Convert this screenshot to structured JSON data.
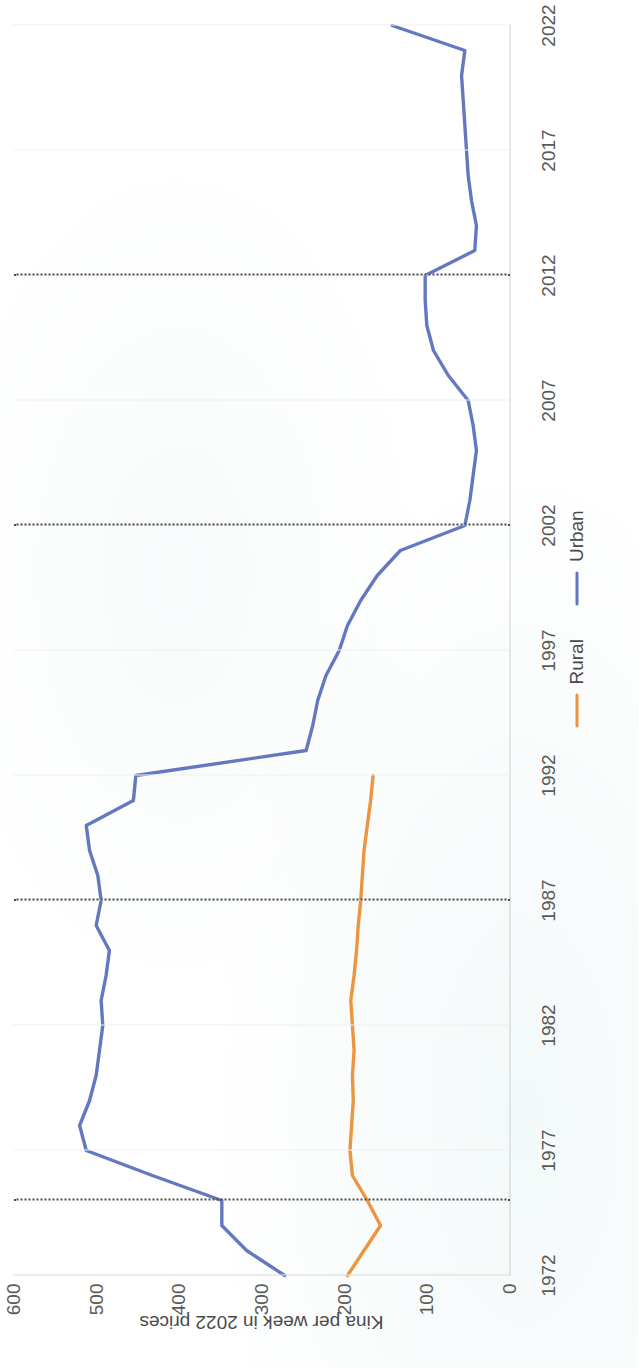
{
  "chart_data": {
    "type": "line",
    "title": "",
    "xlabel": "",
    "ylabel": "Kina per week in 2022 prices",
    "xlim": [
      1972,
      2022
    ],
    "ylim": [
      0,
      600
    ],
    "y_ticks": [
      0,
      100,
      200,
      300,
      400,
      500,
      600
    ],
    "x_ticks": [
      1972,
      1977,
      1982,
      1987,
      1992,
      1997,
      2002,
      2007,
      2012,
      2017,
      2022
    ],
    "grid": "vertical-light",
    "legend_position": "bottom-right",
    "reference_lines": [
      1975,
      1987,
      2002,
      2012
    ],
    "series": [
      {
        "name": "Rural",
        "color": "#ED9440",
        "x": [
          1972,
          1973,
          1974,
          1975,
          1976,
          1977,
          1978,
          1979,
          1980,
          1981,
          1982,
          1983,
          1984,
          1985,
          1986,
          1987,
          1988,
          1989,
          1990,
          1991,
          1992
        ],
        "values": [
          196,
          176,
          156,
          172,
          190,
          193,
          191,
          189,
          190,
          188,
          190,
          192,
          188,
          185,
          183,
          180,
          178,
          176,
          172,
          168,
          165
        ]
      },
      {
        "name": "Urban",
        "color": "#6478C0",
        "x": [
          1972,
          1973,
          1974,
          1975,
          1976,
          1977,
          1978,
          1979,
          1980,
          1981,
          1982,
          1983,
          1984,
          1985,
          1986,
          1987,
          1988,
          1989,
          1990,
          1991,
          1992,
          1993,
          1994,
          1995,
          1996,
          1997,
          1998,
          1999,
          2000,
          2001,
          2002,
          2003,
          2004,
          2005,
          2006,
          2007,
          2008,
          2009,
          2010,
          2011,
          2012,
          2013,
          2014,
          2015,
          2016,
          2017,
          2018,
          2019,
          2020,
          2021,
          2022
        ],
        "values": [
          272,
          318,
          348,
          348,
          432,
          512,
          520,
          508,
          500,
          496,
          492,
          494,
          488,
          484,
          500,
          494,
          498,
          508,
          512,
          455,
          452,
          246,
          238,
          232,
          222,
          206,
          196,
          180,
          160,
          132,
          54,
          48,
          44,
          40,
          44,
          50,
          74,
          92,
          100,
          102,
          102,
          42,
          40,
          46,
          50,
          52,
          54,
          56,
          58,
          54,
          142
        ]
      }
    ]
  },
  "legend": {
    "items": [
      {
        "label": "Rural",
        "color": "#ED9440"
      },
      {
        "label": "Urban",
        "color": "#6478C0"
      }
    ]
  },
  "axes": {
    "y_title": "Kina per week in 2022 prices"
  }
}
